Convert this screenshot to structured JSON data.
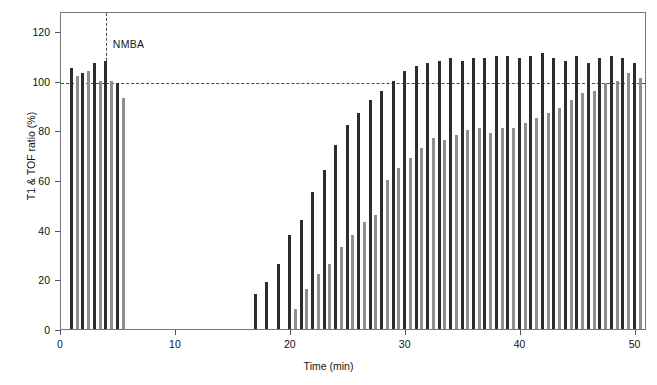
{
  "chart_data": {
    "type": "bar",
    "title": "",
    "subtitle": "",
    "xlabel": "Time (min)",
    "ylabel": "T1 & TOF ratio (%)",
    "xlim": [
      0,
      51
    ],
    "ylim": [
      0,
      128
    ],
    "xticks": [
      0,
      10,
      20,
      30,
      40,
      50
    ],
    "yticks": [
      0,
      20,
      40,
      60,
      80,
      100,
      120
    ],
    "grid": false,
    "legend_position": "none",
    "annotations": [
      {
        "text": "NMBA",
        "type": "vline-label",
        "x": 3.9,
        "y": 118
      }
    ],
    "reference_lines": [
      {
        "orientation": "horizontal",
        "value": 100,
        "style": "dashed",
        "color": "#4a4a4a"
      },
      {
        "orientation": "vertical",
        "value": 3.9,
        "style": "dashed",
        "color": "#4a4a4a"
      }
    ],
    "series": [
      {
        "name": "T1",
        "color": "#2c2c2c",
        "x": [
          0.9,
          1.9,
          2.9,
          3.9,
          4.9,
          16.9,
          17.9,
          18.9,
          19.9,
          20.9,
          21.9,
          22.9,
          23.9,
          24.9,
          25.9,
          26.9,
          27.9,
          28.9,
          29.9,
          30.9,
          31.9,
          32.9,
          33.9,
          34.9,
          35.9,
          36.9,
          37.9,
          38.9,
          39.9,
          40.9,
          41.9,
          42.9,
          43.9,
          44.9,
          45.9,
          46.9,
          47.9,
          48.9,
          49.9
        ],
        "values": [
          105,
          103,
          107,
          108,
          99,
          14,
          19,
          26,
          38,
          44,
          55,
          64,
          74,
          82,
          87,
          92,
          96,
          100,
          104,
          106,
          107,
          108,
          109,
          108,
          109,
          109,
          110,
          110,
          109,
          110,
          111,
          109,
          108,
          110,
          107,
          109,
          110,
          109,
          107
        ]
      },
      {
        "name": "TOF ratio",
        "color": "#8e8e8e",
        "x": [
          1.4,
          2.4,
          3.4,
          4.4,
          5.4,
          17.4,
          18.4,
          19.4,
          20.4,
          21.4,
          22.4,
          23.4,
          24.4,
          25.4,
          26.4,
          27.4,
          28.4,
          29.4,
          30.4,
          31.4,
          32.4,
          33.4,
          34.4,
          35.4,
          36.4,
          37.4,
          38.4,
          39.4,
          40.4,
          41.4,
          42.4,
          43.4,
          44.4,
          45.4,
          46.4,
          47.4,
          48.4,
          49.4,
          50.4
        ],
        "values": [
          102,
          104,
          100,
          100,
          93,
          0,
          0,
          0,
          8,
          16,
          22,
          26,
          33,
          38,
          43,
          46,
          60,
          65,
          69,
          73,
          77,
          76,
          78,
          80,
          81,
          79,
          81,
          81,
          83,
          85,
          87,
          89,
          92,
          95,
          96,
          99,
          100,
          103,
          101
        ]
      }
    ]
  },
  "axis": {
    "y_tick_labels": [
      "0",
      "20",
      "40",
      "60",
      "80",
      "100",
      "120"
    ],
    "x_tick_labels": [
      "0",
      "10",
      "20",
      "30",
      "40",
      "50"
    ]
  }
}
